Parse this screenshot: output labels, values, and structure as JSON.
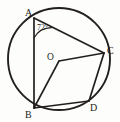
{
  "figure": {
    "kind": "circle-geometry-diagram",
    "background_color": "#fdfdfc",
    "stroke_color": "#231f20"
  },
  "labels": {
    "point_a": "A",
    "point_b": "B",
    "point_c": "C",
    "point_d": "D",
    "center": "O",
    "angle_at_a": "72°"
  },
  "geometry": {
    "circle": {
      "cx": 59,
      "cy": 59,
      "r": 51
    },
    "points": {
      "A": {
        "x": 34,
        "y": 18
      },
      "B": {
        "x": 34,
        "y": 108
      },
      "C": {
        "x": 104,
        "y": 53
      },
      "D": {
        "x": 89,
        "y": 101
      },
      "O": {
        "x": 59,
        "y": 61
      }
    },
    "segments": [
      {
        "name": "chord-AB",
        "from": "A",
        "to": "B"
      },
      {
        "name": "chord-AC",
        "from": "A",
        "to": "C"
      },
      {
        "name": "radius-OC",
        "from": "O",
        "to": "C"
      },
      {
        "name": "radius-OB",
        "from": "O",
        "to": "B"
      },
      {
        "name": "chord-BD",
        "from": "B",
        "to": "D"
      },
      {
        "name": "chord-CD",
        "from": "C",
        "to": "D"
      }
    ],
    "angle_marks": [
      {
        "name": "angle-BAC",
        "vertex": "A",
        "value": "72°"
      }
    ]
  }
}
